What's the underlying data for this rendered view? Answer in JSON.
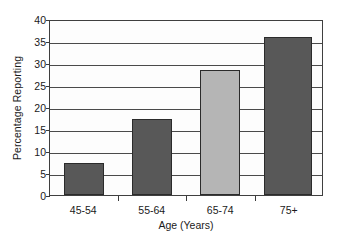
{
  "chart_data": {
    "type": "bar",
    "title": "",
    "subtitle": "",
    "xlabel": "Age (Years)",
    "ylabel": "Percentage Reporting",
    "categories": [
      "45-54",
      "55-64",
      "65-74",
      "75+"
    ],
    "values": [
      7.3,
      17.3,
      28.4,
      36.0
    ],
    "bar_colors": [
      "#585858",
      "#585858",
      "#b5b5b5",
      "#585858"
    ],
    "bar_border_color": "#2b2b2b",
    "ylim": [
      0,
      40
    ],
    "y_ticks": [
      0,
      5,
      10,
      15,
      20,
      25,
      30,
      35,
      40
    ],
    "y_tick_labels": [
      "0",
      "5",
      "10",
      "15",
      "20",
      "25",
      "30",
      "35",
      "40"
    ],
    "grid": true,
    "grid_axis": "y",
    "grid_color": "#4a4a4a",
    "legend": false,
    "legend_position": "none",
    "plot_background": "#fdfdfd",
    "figure_background": "#ffffff",
    "axis_color": "#3f3f3f",
    "annotations": []
  }
}
